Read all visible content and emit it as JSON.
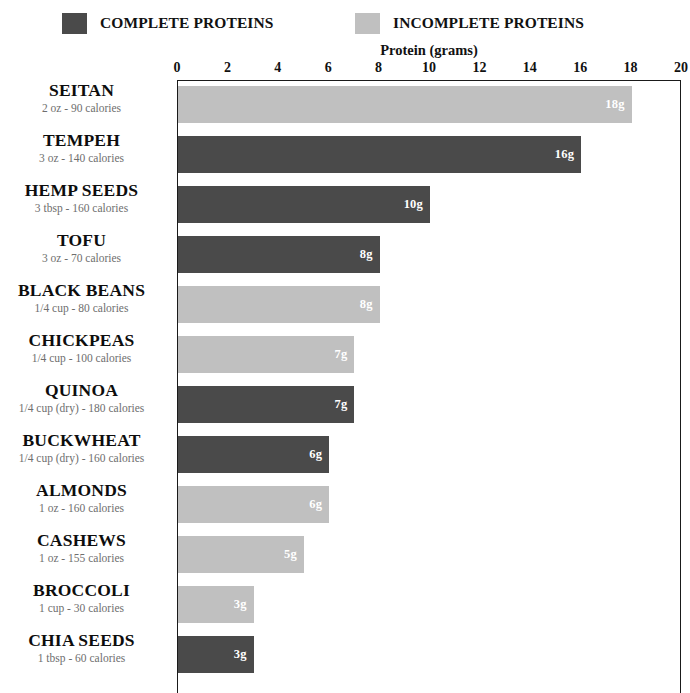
{
  "legend": {
    "complete": {
      "label": "COMPLETE PROTEINS",
      "color": "#4a4a4a",
      "swatch_name": "legend-swatch-complete"
    },
    "incomplete": {
      "label": "INCOMPLETE PROTEINS",
      "color": "#c0c0c0",
      "swatch_name": "legend-swatch-incomplete"
    }
  },
  "chart_data": {
    "type": "bar",
    "orientation": "horizontal",
    "title": "",
    "xlabel": "Protein (grams)",
    "ylabel": "",
    "xlim": [
      0,
      20
    ],
    "xticks": [
      0,
      2,
      4,
      6,
      8,
      10,
      12,
      14,
      16,
      18,
      20
    ],
    "xtick_labels": [
      "0",
      "2",
      "4",
      "6",
      "8",
      "10",
      "12",
      "14",
      "16",
      "18",
      "20"
    ],
    "grid": false,
    "legend_position": "top",
    "series": [
      {
        "name": "COMPLETE PROTEINS",
        "color": "#4a4a4a"
      },
      {
        "name": "INCOMPLETE PROTEINS",
        "color": "#c0c0c0"
      }
    ],
    "categories": [
      "SEITAN",
      "TEMPEH",
      "HEMP SEEDS",
      "TOFU",
      "BLACK BEANS",
      "CHICKPEAS",
      "QUINOA",
      "BUCKWHEAT",
      "ALMONDS",
      "CASHEWS",
      "BROCCOLI",
      "CHIA SEEDS"
    ],
    "values": [
      18,
      16,
      10,
      8,
      8,
      7,
      7,
      6,
      6,
      5,
      3,
      3
    ],
    "data_labels": [
      "18g",
      "16g",
      "10g",
      "8g",
      "8g",
      "7g",
      "7g",
      "6g",
      "6g",
      "5g",
      "3g",
      "3g"
    ],
    "rows": [
      {
        "name": "SEITAN",
        "serving": "2 oz - 90 calories",
        "value": 18,
        "label": "18g",
        "type": "incomplete"
      },
      {
        "name": "TEMPEH",
        "serving": "3 oz - 140 calories",
        "value": 16,
        "label": "16g",
        "type": "complete"
      },
      {
        "name": "HEMP SEEDS",
        "serving": "3 tbsp - 160 calories",
        "value": 10,
        "label": "10g",
        "type": "complete"
      },
      {
        "name": "TOFU",
        "serving": "3 oz - 70 calories",
        "value": 8,
        "label": "8g",
        "type": "complete"
      },
      {
        "name": "BLACK BEANS",
        "serving": "1/4 cup - 80 calories",
        "value": 8,
        "label": "8g",
        "type": "incomplete"
      },
      {
        "name": "CHICKPEAS",
        "serving": "1/4 cup - 100 calories",
        "value": 7,
        "label": "7g",
        "type": "incomplete"
      },
      {
        "name": "QUINOA",
        "serving": "1/4 cup (dry) - 180 calories",
        "value": 7,
        "label": "7g",
        "type": "complete"
      },
      {
        "name": "BUCKWHEAT",
        "serving": "1/4 cup (dry) - 160 calories",
        "value": 6,
        "label": "6g",
        "type": "complete"
      },
      {
        "name": "ALMONDS",
        "serving": "1 oz - 160 calories",
        "value": 6,
        "label": "6g",
        "type": "incomplete"
      },
      {
        "name": "CASHEWS",
        "serving": "1 oz - 155 calories",
        "value": 5,
        "label": "5g",
        "type": "incomplete"
      },
      {
        "name": "BROCCOLI",
        "serving": "1 cup - 30 calories",
        "value": 3,
        "label": "3g",
        "type": "incomplete"
      },
      {
        "name": "CHIA SEEDS",
        "serving": "1 tbsp - 60 calories",
        "value": 3,
        "label": "3g",
        "type": "complete"
      }
    ]
  }
}
